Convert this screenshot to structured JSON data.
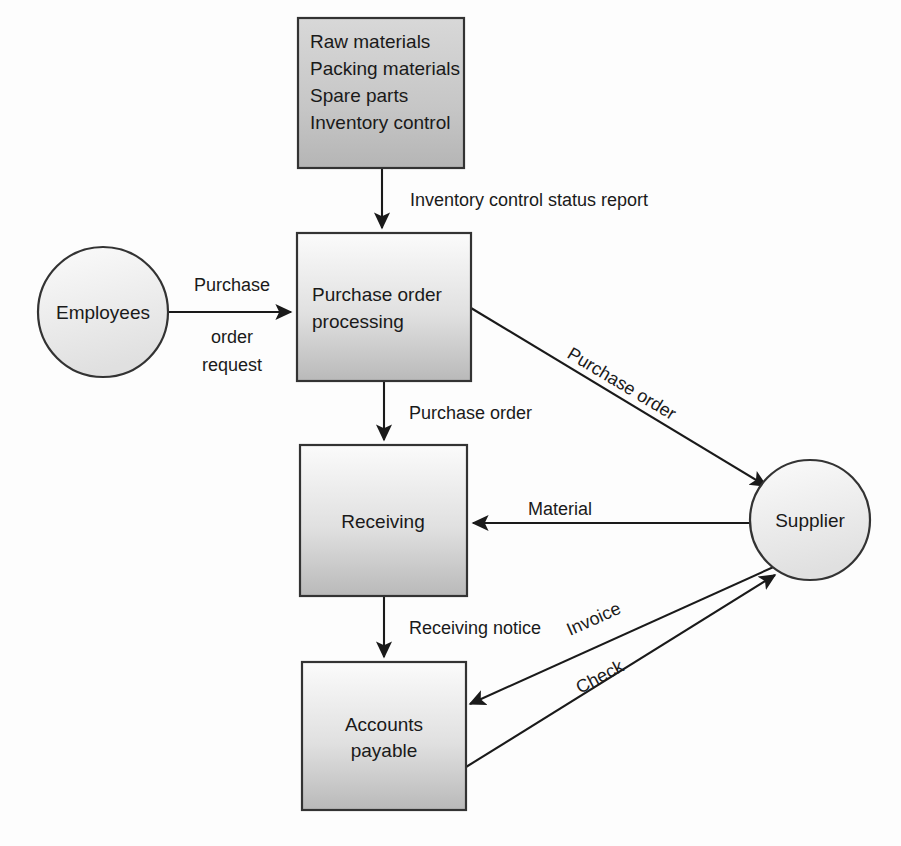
{
  "diagram": {
    "colors": {
      "box_fill_top": "#fbfbfb",
      "box_fill_bottom": "#b9b9b9",
      "top_box_fill_top": "#d4d4d4",
      "top_box_fill_bottom": "#b5b5b5",
      "circle_fill_top": "#fafafa",
      "circle_fill_bottom": "#e2e2e2",
      "stroke": "#333333",
      "text": "#1a1a1a",
      "background": "#fdfdfd"
    },
    "nodes": [
      {
        "id": "inventory-sources",
        "type": "box",
        "x": 298,
        "y": 18,
        "width": 166,
        "height": 150,
        "lines": [
          "Raw materials",
          "Packing materials",
          "Spare parts",
          "Inventory control"
        ],
        "align": "left"
      },
      {
        "id": "purchase-order-processing",
        "type": "box",
        "x": 297,
        "y": 233,
        "width": 174,
        "height": 148,
        "lines": [
          "Purchase order",
          "processing"
        ],
        "align": "left"
      },
      {
        "id": "receiving",
        "type": "box",
        "x": 300,
        "y": 445,
        "width": 167,
        "height": 151,
        "lines": [
          "Receiving"
        ],
        "align": "center"
      },
      {
        "id": "accounts-payable",
        "type": "box",
        "x": 302,
        "y": 662,
        "width": 164,
        "height": 148,
        "lines": [
          "Accounts",
          "payable"
        ],
        "align": "center"
      },
      {
        "id": "employees",
        "type": "circle",
        "cx": 103,
        "cy": 312,
        "r": 65,
        "lines": [
          "Employees"
        ]
      },
      {
        "id": "supplier",
        "type": "circle",
        "cx": 810,
        "cy": 520,
        "r": 60,
        "lines": [
          "Supplier"
        ]
      }
    ],
    "edges": [
      {
        "id": "inventory-to-po",
        "label": "Inventory control status report",
        "from": "inventory-sources",
        "to": "purchase-order-processing",
        "label_x": 410,
        "label_y": 206,
        "rotate": 0,
        "anchor": "start"
      },
      {
        "id": "employees-to-po",
        "label_lines": [
          "Purchase",
          "order",
          "request"
        ],
        "from": "employees",
        "to": "purchase-order-processing",
        "label_x": 232,
        "label_y": 291,
        "rotate": 0,
        "anchor": "middle"
      },
      {
        "id": "po-to-supplier",
        "label": "Purchase order",
        "from": "purchase-order-processing",
        "to": "supplier",
        "label_x": 566,
        "label_y": 357,
        "rotate": 31,
        "anchor": "start"
      },
      {
        "id": "po-to-receiving",
        "label": "Purchase order",
        "from": "purchase-order-processing",
        "to": "receiving",
        "label_x": 409,
        "label_y": 419,
        "rotate": 0,
        "anchor": "start"
      },
      {
        "id": "supplier-to-receiving",
        "label": "Material",
        "from": "supplier",
        "to": "receiving",
        "label_x": 528,
        "label_y": 515,
        "rotate": 0,
        "anchor": "start"
      },
      {
        "id": "receiving-to-ap",
        "label": "Receiving notice",
        "from": "receiving",
        "to": "accounts-payable",
        "label_x": 409,
        "label_y": 634,
        "rotate": 0,
        "anchor": "start"
      },
      {
        "id": "supplier-to-ap-invoice",
        "label": "Invoice",
        "from": "supplier",
        "to": "accounts-payable",
        "label_x": 570,
        "label_y": 636,
        "rotate": -31,
        "anchor": "start"
      },
      {
        "id": "ap-to-supplier-check",
        "label": "Check",
        "from": "accounts-payable",
        "to": "supplier",
        "label_x": 580,
        "label_y": 690,
        "rotate": -31,
        "anchor": "start"
      }
    ]
  }
}
